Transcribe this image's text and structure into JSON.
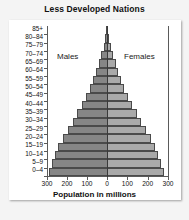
{
  "chart_data": {
    "type": "bar",
    "title": "Less Developed Nations",
    "subtitle": "",
    "xlabel": "Population in millions",
    "ylabel": "",
    "orientation": "horizontal",
    "layout": "population-pyramid",
    "grid": false,
    "legend_position": "inside-plot",
    "xlim": [
      -300,
      300
    ],
    "xticks": [
      -300,
      -200,
      -100,
      0,
      100,
      200,
      300
    ],
    "xtick_labels": [
      "300",
      "200",
      "100",
      "0",
      "100",
      "200",
      "300"
    ],
    "categories": [
      "0–4",
      "5–9",
      "10–14",
      "15–19",
      "20–24",
      "25–29",
      "30–34",
      "35–39",
      "40–44",
      "45–49",
      "50–54",
      "55–59",
      "60–64",
      "65–69",
      "70–74",
      "75–79",
      "80–84",
      "85+"
    ],
    "series": [
      {
        "name": "Males",
        "color": "#868686",
        "side": "left",
        "values": [
          290,
          275,
          262,
          245,
          222,
          196,
          172,
          150,
          127,
          105,
          86,
          68,
          53,
          40,
          28,
          17,
          9,
          4
        ]
      },
      {
        "name": "Females",
        "color": "#a9a9a9",
        "side": "right",
        "values": [
          278,
          264,
          252,
          236,
          215,
          191,
          168,
          147,
          125,
          104,
          86,
          69,
          55,
          43,
          31,
          20,
          11,
          6
        ]
      }
    ],
    "annotations": [
      {
        "text": "Males",
        "name": "males-label"
      },
      {
        "text": "Females",
        "name": "females-label"
      }
    ]
  },
  "colors": {
    "male_bar": "#868686",
    "female_bar": "#a9a9a9",
    "axis": "#5a5a5a",
    "center_line": "#3a3a3a",
    "text": "#111111",
    "panel": "#ffffff",
    "background": "#f4f4f4"
  }
}
